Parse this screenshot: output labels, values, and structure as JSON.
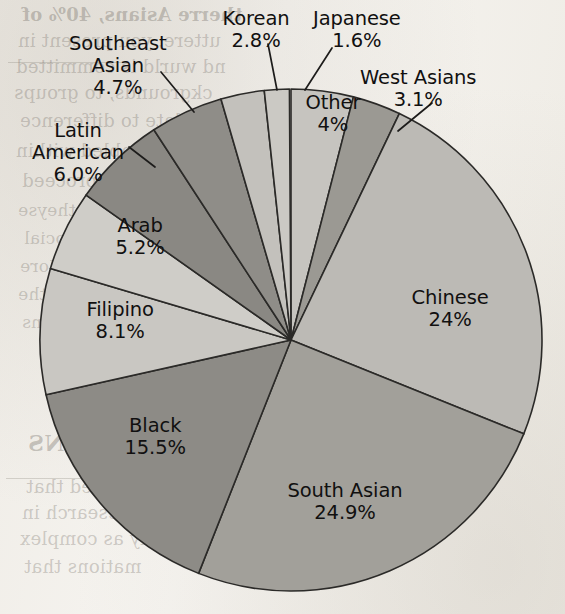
{
  "figure": {
    "media": "scanned-textbook-page",
    "background_color": "#f4f2ee"
  },
  "chart_data": {
    "type": "pie",
    "title": "",
    "subtitle": "",
    "xlabel": "",
    "ylabel": "",
    "legend_position": "none",
    "grid": false,
    "label_format": "name + percent",
    "start_angle_deg": 0,
    "direction": "clockwise",
    "total_percent": 99.9,
    "categories": [
      "Other",
      "West Asians",
      "Chinese",
      "South Asian",
      "Black",
      "Filipino",
      "Arab",
      "Latin American",
      "Southeast Asian",
      "Korean",
      "Japanese"
    ],
    "values": [
      4.0,
      3.1,
      24.0,
      24.9,
      15.5,
      8.1,
      5.2,
      6.0,
      4.7,
      2.8,
      1.6
    ],
    "value_labels": [
      "4%",
      "3.1%",
      "24%",
      "24.9%",
      "15.5%",
      "8.1%",
      "5.2%",
      "6.0%",
      "4.7%",
      "2.8%",
      "1.6%"
    ],
    "slice_colors": [
      "#c6c4bf",
      "#9b9993",
      "#bcbab5",
      "#a2a09a",
      "#8d8b86",
      "#c9c7c2",
      "#cfcdc8",
      "#8a8883",
      "#8f8d88",
      "#c3c1bc",
      "#cbc9c4"
    ],
    "slices": [
      {
        "name": "Other",
        "value": 4.0,
        "value_label": "4%",
        "color": "#c6c4bf",
        "start_deg": 0.0,
        "end_deg": 14.4,
        "label_placement": "inside",
        "label": {
          "x": 333,
          "y": 92,
          "align": "center",
          "lines": [
            "Other",
            "4%"
          ]
        },
        "leader": null
      },
      {
        "name": "West Asians",
        "value": 3.1,
        "value_label": "3.1%",
        "color": "#9b9993",
        "start_deg": 14.4,
        "end_deg": 25.56,
        "label_placement": "outside",
        "label": {
          "x": 418,
          "y": 67,
          "align": "center",
          "lines": [
            "West Asians",
            "3.1%"
          ]
        },
        "leader": {
          "x1": 432,
          "y1": 103,
          "x2": 398,
          "y2": 131
        }
      },
      {
        "name": "Chinese",
        "value": 24.0,
        "value_label": "24%",
        "color": "#bcbab5",
        "start_deg": 25.56,
        "end_deg": 111.96,
        "label_placement": "inside",
        "label": {
          "x": 450,
          "y": 287,
          "align": "center",
          "lines": [
            "Chinese",
            "24%"
          ]
        },
        "leader": null
      },
      {
        "name": "South Asian",
        "value": 24.9,
        "value_label": "24.9%",
        "color": "#a2a09a",
        "start_deg": 111.96,
        "end_deg": 201.6,
        "label_placement": "inside",
        "label": {
          "x": 345,
          "y": 480,
          "align": "center",
          "lines": [
            "South Asian",
            "24.9%"
          ]
        },
        "leader": null
      },
      {
        "name": "Black",
        "value": 15.5,
        "value_label": "15.5%",
        "color": "#8d8b86",
        "start_deg": 201.6,
        "end_deg": 257.4,
        "label_placement": "inside",
        "label": {
          "x": 155,
          "y": 415,
          "align": "center",
          "lines": [
            "Black",
            "15.5%"
          ]
        },
        "leader": null
      },
      {
        "name": "Filipino",
        "value": 8.1,
        "value_label": "8.1%",
        "color": "#c9c7c2",
        "start_deg": 257.4,
        "end_deg": 286.56,
        "label_placement": "inside",
        "label": {
          "x": 120,
          "y": 299,
          "align": "center",
          "lines": [
            "Filipino",
            "8.1%"
          ]
        },
        "leader": null
      },
      {
        "name": "Arab",
        "value": 5.2,
        "value_label": "5.2%",
        "color": "#cfcdc8",
        "start_deg": 286.56,
        "end_deg": 305.28,
        "label_placement": "inside",
        "label": {
          "x": 140,
          "y": 215,
          "align": "center",
          "lines": [
            "Arab",
            "5.2%"
          ]
        },
        "leader": null
      },
      {
        "name": "Latin American",
        "value": 6.0,
        "value_label": "6.0%",
        "color": "#8a8883",
        "start_deg": 305.28,
        "end_deg": 326.88,
        "label_placement": "outside",
        "label": {
          "x": 78,
          "y": 120,
          "align": "center",
          "lines": [
            "Latin",
            "American",
            "6.0%"
          ]
        },
        "leader": {
          "x1": 129,
          "y1": 147,
          "x2": 155,
          "y2": 167
        }
      },
      {
        "name": "Southeast Asian",
        "value": 4.7,
        "value_label": "4.7%",
        "color": "#8f8d88",
        "start_deg": 326.88,
        "end_deg": 343.8,
        "label_placement": "outside",
        "label": {
          "x": 118,
          "y": 33,
          "align": "center",
          "lines": [
            "Southeast",
            "Asian",
            "4.7%"
          ]
        },
        "leader": {
          "x1": 161,
          "y1": 72,
          "x2": 194,
          "y2": 112
        }
      },
      {
        "name": "Korean",
        "value": 2.8,
        "value_label": "2.8%",
        "color": "#c3c1bc",
        "start_deg": 343.8,
        "end_deg": 353.88,
        "label_placement": "outside",
        "label": {
          "x": 256,
          "y": 8,
          "align": "center",
          "lines": [
            "Korean",
            "2.8%"
          ]
        },
        "leader": {
          "x1": 268,
          "y1": 44,
          "x2": 277,
          "y2": 90
        }
      },
      {
        "name": "Japanese",
        "value": 1.6,
        "value_label": "1.6%",
        "color": "#cbc9c4",
        "start_deg": 353.88,
        "end_deg": 359.64,
        "label_placement": "outside",
        "label": {
          "x": 357,
          "y": 8,
          "align": "center",
          "lines": [
            "Japanese",
            "1.6%"
          ]
        },
        "leader": {
          "x1": 332,
          "y1": 48,
          "x2": 305,
          "y2": 90
        }
      }
    ],
    "geometry": {
      "center_x": 291,
      "center_y": 340,
      "radius": 251
    }
  },
  "showthrough_text": {
    "note": "faint mirrored bleed-through text from reverse page",
    "lines": [
      {
        "text": "therre Asians, 40% of",
        "x": 22,
        "y": 4,
        "size": 18,
        "bold": true
      },
      {
        "text": "uttere, you present in",
        "x": 18,
        "y": 30,
        "size": 18,
        "bold": false
      },
      {
        "text": "nd wurld is committed",
        "x": 16,
        "y": 56,
        "size": 18,
        "bold": false
      },
      {
        "text": "ckgrounds, to groups",
        "x": 14,
        "y": 82,
        "size": 18,
        "bold": false
      },
      {
        "text": "ulate to difference",
        "x": 20,
        "y": 110,
        "size": 18,
        "bold": false
      },
      {
        "text": "tions enabled within",
        "x": 16,
        "y": 140,
        "size": 18,
        "bold": false
      },
      {
        "text": "How we proceed",
        "x": 22,
        "y": 170,
        "size": 18,
        "bold": false
      },
      {
        "text": "ngernent if theyse",
        "x": 18,
        "y": 200,
        "size": 17,
        "bold": false
      },
      {
        "text": "orm of the social",
        "x": 24,
        "y": 228,
        "size": 17,
        "bold": false
      },
      {
        "text": "nie thaugh a More",
        "x": 20,
        "y": 256,
        "size": 17,
        "bold": false
      },
      {
        "text": "nd to analyse the",
        "x": 18,
        "y": 284,
        "size": 17,
        "bold": false
      },
      {
        "text": "ive dimensions",
        "x": 22,
        "y": 312,
        "size": 17,
        "bold": false
      },
      {
        "text": "CLUSIONS",
        "x": 28,
        "y": 430,
        "size": 22,
        "bold": true
      },
      {
        "text": "stressed that",
        "x": 26,
        "y": 476,
        "size": 18,
        "bold": false
      },
      {
        "text": "research in",
        "x": 22,
        "y": 502,
        "size": 18,
        "bold": false
      },
      {
        "text": "phy as complex",
        "x": 20,
        "y": 528,
        "size": 18,
        "bold": false
      },
      {
        "text": "mations that",
        "x": 24,
        "y": 556,
        "size": 18,
        "bold": false
      }
    ],
    "rules": [
      {
        "x": 8,
        "y": 62,
        "width": 120
      },
      {
        "x": 6,
        "y": 478,
        "width": 150
      }
    ]
  }
}
